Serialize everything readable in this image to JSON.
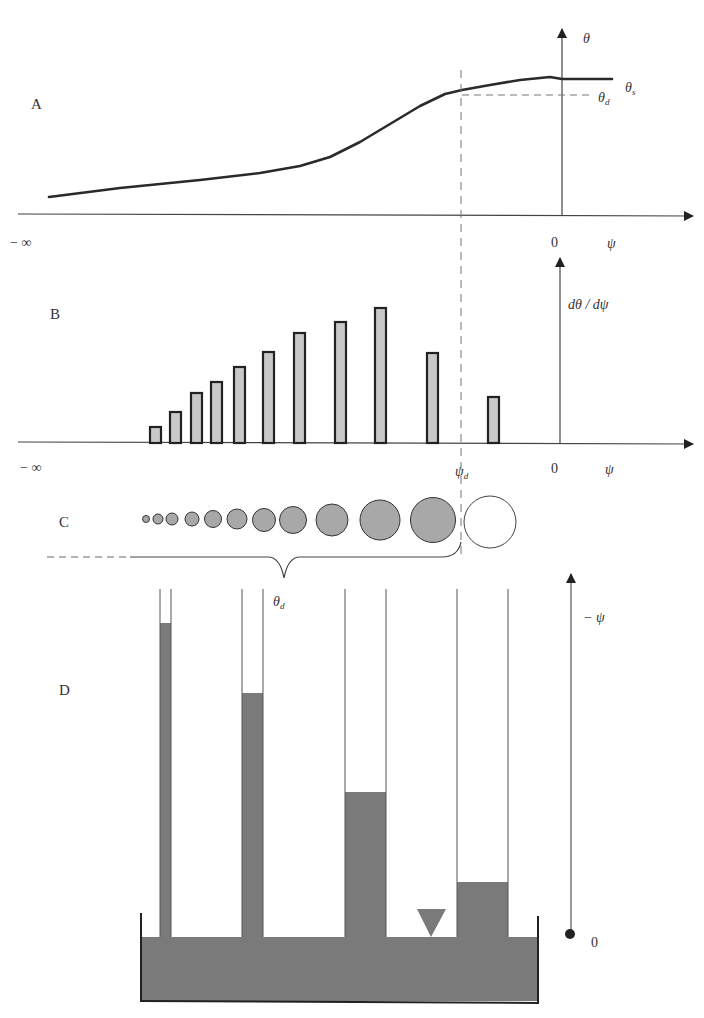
{
  "panels": {
    "A": {
      "letter": "A",
      "y_label": "θ",
      "theta_s_label": "θ",
      "theta_s_sub": "s",
      "theta_d_label": "θ",
      "theta_d_sub": "d",
      "x_label": "ψ",
      "origin_label": "0",
      "neg_inf_label": "− ∞"
    },
    "B": {
      "letter": "B",
      "y_label": "dθ / dψ",
      "x_label": "ψ",
      "origin_label": "0",
      "neg_inf_label": "− ∞",
      "psi_d_label": "ψ",
      "psi_d_sub": "d"
    },
    "C": {
      "letter": "C",
      "brace_label": "θ",
      "brace_sub": "d"
    },
    "D": {
      "letter": "D",
      "y_label": "− ψ",
      "origin_label": "0"
    }
  },
  "colors": {
    "line": "#333333",
    "bar_fill": "#c8c8c8",
    "pore_fill": "#a8a8a8",
    "water": "#7a7a7a",
    "dashed": "#666666"
  },
  "chart_data": [
    {
      "type": "line",
      "title": "A: Soil water retention curve",
      "xlabel": "ψ",
      "ylabel": "θ",
      "x_ticks": [
        "− ∞",
        "0"
      ],
      "annotations": [
        "θs (saturated water content)",
        "θd (water content at ψd)"
      ],
      "points_px": [
        [
          49,
          197
        ],
        [
          120,
          188
        ],
        [
          200,
          180
        ],
        [
          260,
          173
        ],
        [
          300,
          166
        ],
        [
          330,
          157
        ],
        [
          360,
          142
        ],
        [
          390,
          124
        ],
        [
          420,
          106
        ],
        [
          445,
          94
        ],
        [
          462,
          90
        ],
        [
          490,
          85
        ],
        [
          520,
          80
        ],
        [
          540,
          78
        ],
        [
          550,
          77
        ],
        [
          562,
          79
        ],
        [
          612,
          79
        ]
      ]
    },
    {
      "type": "bar",
      "title": "B: Pore-size distribution dθ/dψ",
      "xlabel": "ψ",
      "ylabel": "dθ / dψ",
      "x_ticks": [
        "− ∞",
        "ψd",
        "0"
      ],
      "categories": [
        "1",
        "2",
        "3",
        "4",
        "5",
        "6",
        "7",
        "8",
        "9",
        "10",
        "11"
      ],
      "values": [
        16,
        31,
        50,
        61,
        76,
        91,
        110,
        121,
        135,
        90,
        46
      ],
      "bars_px": [
        {
          "x": 150,
          "w": 11,
          "top": 427
        },
        {
          "x": 170,
          "w": 11,
          "top": 412
        },
        {
          "x": 191,
          "w": 11,
          "top": 393
        },
        {
          "x": 211,
          "w": 11,
          "top": 382
        },
        {
          "x": 234,
          "w": 11,
          "top": 367
        },
        {
          "x": 263,
          "w": 11,
          "top": 352
        },
        {
          "x": 294,
          "w": 11,
          "top": 333
        },
        {
          "x": 335,
          "w": 11,
          "top": 322
        },
        {
          "x": 375,
          "w": 11,
          "top": 308
        },
        {
          "x": 427,
          "w": 11,
          "top": 353
        },
        {
          "x": 488,
          "w": 11,
          "top": 397
        }
      ]
    }
  ],
  "pores": {
    "filled": [
      {
        "cx": 146,
        "cy": 519,
        "r": 3.5
      },
      {
        "cx": 158,
        "cy": 519,
        "r": 5
      },
      {
        "cx": 172,
        "cy": 519,
        "r": 6
      },
      {
        "cx": 192,
        "cy": 519,
        "r": 7
      },
      {
        "cx": 213,
        "cy": 519,
        "r": 8.5
      },
      {
        "cx": 237,
        "cy": 519,
        "r": 10
      },
      {
        "cx": 264,
        "cy": 520,
        "r": 11.5
      },
      {
        "cx": 293,
        "cy": 520,
        "r": 13.5
      },
      {
        "cx": 332,
        "cy": 520,
        "r": 16
      },
      {
        "cx": 380,
        "cy": 520,
        "r": 20
      },
      {
        "cx": 433,
        "cy": 520,
        "r": 22.5
      }
    ],
    "empty": [
      {
        "cx": 490,
        "cy": 522,
        "r": 26
      }
    ]
  },
  "tubes": [
    {
      "x1": 160,
      "x2": 171,
      "water_top": 623
    },
    {
      "x1": 242,
      "x2": 263,
      "water_top": 693
    },
    {
      "x1": 345,
      "x2": 386,
      "water_top": 792
    },
    {
      "x1": 457,
      "x2": 508,
      "water_top": 882
    }
  ]
}
